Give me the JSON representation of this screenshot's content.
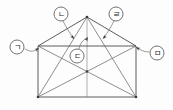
{
  "figure": {
    "title": "",
    "background_color": "#fdfdfd",
    "stroke_color": "#4a4a4a",
    "inner_stroke_color": "#6a6a6a",
    "label_text_color": "#2b2b2b",
    "label_circle_fill": "#ffffff",
    "arrow_color": "#3c3c3c",
    "shape_name": "pentagon-house-with-diagonals"
  },
  "geometry": {
    "apex": {
      "x": 87,
      "y": 17
    },
    "shoulder_left": {
      "x": 38,
      "y": 46
    },
    "shoulder_right": {
      "x": 136,
      "y": 46
    },
    "base_left": {
      "x": 38,
      "y": 97
    },
    "base_right": {
      "x": 136,
      "y": 97
    },
    "center": {
      "x": 87,
      "y": 71.5
    },
    "outline_path": "M 38 46 L 87 17 L 136 46 L 136 97 L 38 97 Z",
    "inner_lines": [
      {
        "name": "vertical-axis",
        "x1": 87,
        "y1": 17,
        "x2": 87,
        "y2": 97
      },
      {
        "name": "apex-to-base-left",
        "x1": 87,
        "y1": 17,
        "x2": 38,
        "y2": 97
      },
      {
        "name": "apex-to-base-right",
        "x1": 87,
        "y1": 17,
        "x2": 136,
        "y2": 97
      },
      {
        "name": "diagonal-tl-br",
        "x1": 38,
        "y1": 46,
        "x2": 136,
        "y2": 97
      },
      {
        "name": "diagonal-tr-bl",
        "x1": 136,
        "y1": 46,
        "x2": 38,
        "y2": 97
      },
      {
        "name": "shoulder-line",
        "x1": 38,
        "y1": 46,
        "x2": 136,
        "y2": 46
      }
    ]
  },
  "labels": [
    {
      "id": "label-giyeok",
      "text": "ㄱ",
      "circle": {
        "cx": 17,
        "cy": 47,
        "r": 7
      },
      "leader_path": "M 25 49 C 32 53, 34 51, 38.5 48.5",
      "arrow_at": {
        "x": 39,
        "y": 48
      },
      "arrow_rotation": -34,
      "points_to": "left-roof-edge-near-shoulder"
    },
    {
      "id": "label-nieun",
      "text": "ㄴ",
      "circle": {
        "cx": 61,
        "cy": 14,
        "r": 7
      },
      "leader_path": "M 63 21 C 66 27, 69 32, 73.5 38",
      "arrow_at": {
        "x": 74,
        "y": 39
      },
      "arrow_rotation": 52,
      "points_to": "left-roof-inner-region"
    },
    {
      "id": "label-digeut",
      "text": "ㄷ",
      "circle": {
        "cx": 77,
        "cy": 56,
        "r": 7
      },
      "leader_path": "M 79 49 C 80 43, 83 40, 87 38",
      "arrow_at": {
        "x": 88,
        "y": 37
      },
      "arrow_rotation": -58,
      "points_to": "central-triangle-region"
    },
    {
      "id": "label-rieul",
      "text": "ㄹ",
      "circle": {
        "cx": 116,
        "cy": 14,
        "r": 7
      },
      "leader_path": "M 114 21 C 111 27, 108 32, 103.5 38",
      "arrow_at": {
        "x": 103,
        "y": 39
      },
      "arrow_rotation": 128,
      "points_to": "right-roof-inner-region"
    },
    {
      "id": "label-mieum",
      "text": "ㅁ",
      "circle": {
        "cx": 157,
        "cy": 53,
        "r": 7
      },
      "leader_path": "M 149 52 C 143 52, 141 50, 136.5 47.5",
      "arrow_at": {
        "x": 136,
        "y": 47
      },
      "arrow_rotation": 214,
      "points_to": "right-roof-edge-near-shoulder"
    }
  ]
}
